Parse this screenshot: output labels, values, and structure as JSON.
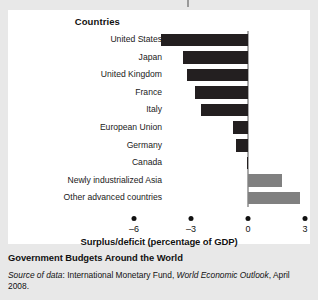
{
  "panel": {
    "column_header": "Countries"
  },
  "caption": {
    "title": "Government Budgets Around the World",
    "source_prefix": "Source of data",
    "source_sep": ": ",
    "source_org": "International Monetary Fund, ",
    "source_pub": "World Economic Outlook",
    "source_date": ", April 2008."
  },
  "colors": {
    "negative_bar": "#231f20",
    "positive_bar": "#808080",
    "zero_line": "#a9a9a9",
    "panel_bg": "#ffffff",
    "page_bg": "#e8e8e8",
    "text": "#111111"
  },
  "chart_data": {
    "type": "bar",
    "orientation": "horizontal",
    "title": "Government Budgets Around the World",
    "xlabel": "Surplus/deficit (percentage of GDP)",
    "ylabel": "Countries",
    "xlim": [
      -6,
      3
    ],
    "xticks": [
      -6,
      -3,
      0,
      3
    ],
    "xticklabels": [
      "–6",
      "–3",
      "0",
      "3"
    ],
    "grid": false,
    "legend": "none",
    "categories": [
      "United States",
      "Japan",
      "United Kingdom",
      "France",
      "Italy",
      "European Union",
      "Germany",
      "Canada",
      "Newly industrialized Asia",
      "Other advanced countries"
    ],
    "values": [
      -4.6,
      -3.4,
      -3.2,
      -2.8,
      -2.5,
      -0.8,
      -0.65,
      -0.05,
      1.8,
      2.75
    ]
  }
}
